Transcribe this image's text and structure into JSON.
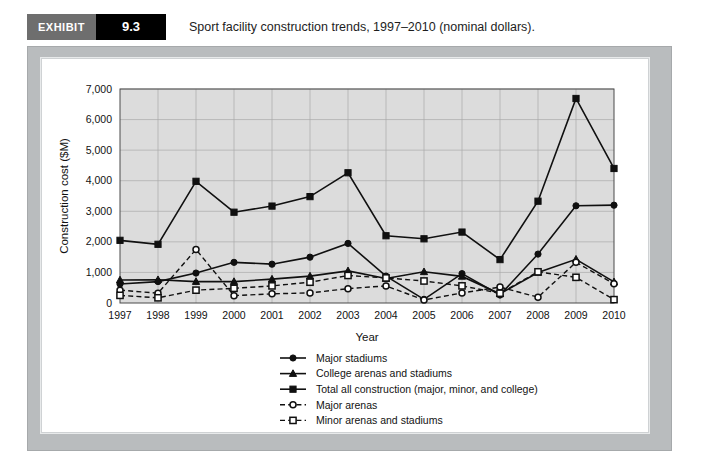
{
  "exhibit": {
    "tag": "EXHIBIT",
    "number": "9.3",
    "caption": "Sport facility construction trends, 1997–2010 (nominal dollars)."
  },
  "chart_data": {
    "type": "line",
    "title": "",
    "xlabel": "Year",
    "ylabel": "Construction cost ($M)",
    "categories": [
      "1997",
      "1998",
      "1999",
      "2000",
      "2001",
      "2002",
      "2003",
      "2004",
      "2005",
      "2006",
      "2007",
      "2008",
      "2009",
      "2010"
    ],
    "xtick_labels": [
      "1997",
      "1998",
      "1999",
      "2000",
      "2001",
      "2002",
      "2003",
      "2004",
      "2005",
      "2006",
      "2007",
      "2008",
      "2009",
      "2010"
    ],
    "ytick_labels": [
      "0",
      "1,000",
      "2,000",
      "3,000",
      "4,000",
      "5,000",
      "6,000",
      "7,000"
    ],
    "yticks": [
      0,
      1000,
      2000,
      3000,
      4000,
      5000,
      6000,
      7000
    ],
    "ylim": [
      0,
      7000
    ],
    "grid": true,
    "legend_position": "bottom-center",
    "plot_background": "#dcdcdc",
    "series": [
      {
        "name": "Major stadiums",
        "marker": "filled-circle",
        "line_style": "solid",
        "color": "#101010",
        "values": [
          620,
          700,
          980,
          1330,
          1270,
          1500,
          1950,
          880,
          120,
          960,
          260,
          1600,
          3180,
          3200
        ]
      },
      {
        "name": "College arenas and stadiums",
        "marker": "filled-triangle",
        "line_style": "solid",
        "color": "#101010",
        "values": [
          750,
          760,
          700,
          700,
          780,
          880,
          1050,
          800,
          1020,
          870,
          300,
          1000,
          1430,
          690
        ]
      },
      {
        "name": "Total all construction (major, minor, and college)",
        "marker": "filled-square",
        "line_style": "solid",
        "color": "#101010",
        "values": [
          2050,
          1920,
          3980,
          2970,
          3170,
          3480,
          4260,
          2200,
          2100,
          2320,
          1420,
          3330,
          6690,
          4400
        ]
      },
      {
        "name": "Major arenas",
        "marker": "open-circle",
        "line_style": "dashed",
        "color": "#101010",
        "values": [
          420,
          320,
          1750,
          240,
          300,
          330,
          470,
          560,
          100,
          330,
          520,
          190,
          1330,
          630
        ]
      },
      {
        "name": "Minor arenas and stadiums",
        "marker": "open-square",
        "line_style": "dashed",
        "color": "#101010",
        "values": [
          250,
          170,
          420,
          480,
          560,
          680,
          900,
          820,
          720,
          560,
          320,
          1020,
          840,
          110
        ]
      }
    ]
  }
}
